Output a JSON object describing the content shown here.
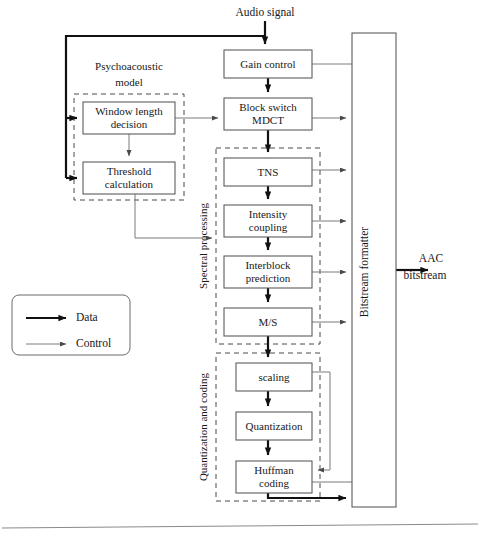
{
  "figure": {
    "title_top": "Audio signal",
    "output_label_line1": "AAC",
    "output_label_line2": "bitstream",
    "caption": "",
    "accent_data_color": "#111111",
    "accent_control_color": "#7a7a7a",
    "box_stroke_color": "#5c5c5c",
    "group_stroke_color": "#4a4a4a"
  },
  "blocks": [
    {
      "id": "gain-control",
      "label": "Gain control",
      "label2": "",
      "x": 224,
      "y": 50,
      "w": 88,
      "h": 28
    },
    {
      "id": "block-switch-mdct",
      "label": "Block switch",
      "label2": "MDCT",
      "x": 224,
      "y": 98,
      "w": 88,
      "h": 32
    },
    {
      "id": "tns",
      "label": "TNS",
      "label2": "",
      "x": 224,
      "y": 158,
      "w": 88,
      "h": 28
    },
    {
      "id": "intensity-coupling",
      "label": "Intensity",
      "label2": "coupling",
      "x": 224,
      "y": 205,
      "w": 88,
      "h": 32
    },
    {
      "id": "interblock-prediction",
      "label": "Interblock",
      "label2": "prediction",
      "x": 224,
      "y": 256,
      "w": 88,
      "h": 32
    },
    {
      "id": "ms",
      "label": "M/S",
      "label2": "",
      "x": 224,
      "y": 308,
      "w": 88,
      "h": 28
    },
    {
      "id": "scaling",
      "label": "scaling",
      "label2": "",
      "x": 236,
      "y": 363,
      "w": 76,
      "h": 28
    },
    {
      "id": "quantization",
      "label": "Quantization",
      "label2": "",
      "x": 236,
      "y": 412,
      "w": 76,
      "h": 28
    },
    {
      "id": "huffman-coding",
      "label": "Huffman",
      "label2": "coding",
      "x": 236,
      "y": 461,
      "w": 76,
      "h": 32
    },
    {
      "id": "window-length-decision",
      "label": "Window length",
      "label2": "decision",
      "x": 83,
      "y": 102,
      "w": 92,
      "h": 32
    },
    {
      "id": "threshold-calculation",
      "label": "Threshold",
      "label2": "calculation",
      "x": 83,
      "y": 162,
      "w": 92,
      "h": 32
    }
  ],
  "groups": [
    {
      "id": "psychoacoustic-model",
      "label": "Psychoacoustic",
      "label2": "model",
      "x": 74,
      "y": 94,
      "w": 110,
      "h": 106,
      "label_x": 129,
      "label_y": 74,
      "orient": "horizontal"
    },
    {
      "id": "spectral-processing",
      "label": "Spectral processing",
      "label2": "",
      "x": 216,
      "y": 148,
      "w": 104,
      "h": 196,
      "label_x": 207,
      "label_y": 246,
      "orient": "vertical"
    },
    {
      "id": "quantization-and-coding",
      "label": "Quantization and coding",
      "label2": "",
      "x": 216,
      "y": 353,
      "w": 104,
      "h": 148,
      "label_x": 207,
      "label_y": 427,
      "orient": "vertical"
    }
  ],
  "formatter": {
    "id": "bitstream-formatter",
    "label": "Bitstream formatter",
    "x": 352,
    "y": 33,
    "w": 44,
    "h": 474
  },
  "legend": {
    "x": 12,
    "y": 295,
    "w": 118,
    "h": 60,
    "items": [
      {
        "id": "legend-data",
        "label": "Data",
        "type": "data",
        "y": 318
      },
      {
        "id": "legend-control",
        "label": "Control",
        "type": "control",
        "y": 344
      }
    ]
  }
}
